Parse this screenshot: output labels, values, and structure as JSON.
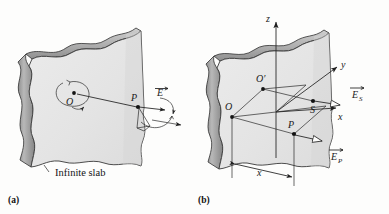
{
  "figure": {
    "kind": "physics-diagram",
    "background_color": "#fdfdfc",
    "ink_color": "#1a1a1a",
    "slab_face_color": "#e6e6e6",
    "slab_edge_color": "#9a9a9a",
    "slab_top_color": "#bdbdbd",
    "slab_outline_color": "#3a3a3a"
  },
  "panels": [
    {
      "id": "a",
      "caption": "(a)",
      "slab_caption": "Infinite slab",
      "points": [
        {
          "name": "O",
          "label": "O"
        },
        {
          "name": "P",
          "label": "P"
        }
      ],
      "vectors": [
        {
          "name": "E",
          "label": "E",
          "subscript": ""
        }
      ],
      "annotations": [
        {
          "name": "rotation-arc-about-O",
          "label": ""
        },
        {
          "name": "rotation-arc-about-P",
          "label": ""
        }
      ]
    },
    {
      "id": "b",
      "caption": "(b)",
      "axes": [
        {
          "name": "z-axis",
          "label": "z"
        },
        {
          "name": "y-axis",
          "label": "y"
        },
        {
          "name": "x-axis",
          "label": "x"
        }
      ],
      "points": [
        {
          "name": "O",
          "label": "O"
        },
        {
          "name": "O-prime",
          "label": "O′"
        },
        {
          "name": "P",
          "label": "P"
        },
        {
          "name": "S",
          "label": "S"
        }
      ],
      "vectors": [
        {
          "name": "E-sub-S",
          "label": "E",
          "subscript": "S"
        },
        {
          "name": "E-sub-P",
          "label": "E",
          "subscript": "P"
        }
      ],
      "dimensions": [
        {
          "name": "x-distance",
          "label": "x"
        }
      ]
    }
  ]
}
